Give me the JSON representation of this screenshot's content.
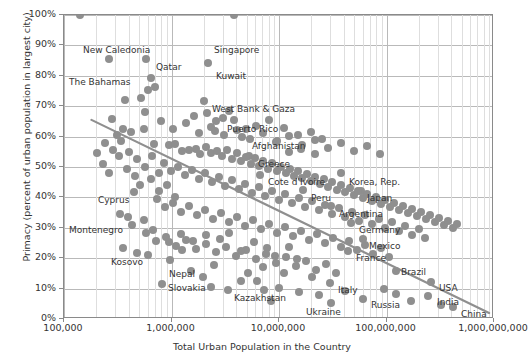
{
  "chart_data": {
    "type": "scatter",
    "title": "",
    "xlabel": "Total Urban Population in the Country",
    "ylabel": "Primacy (percent of urban population in largest city)",
    "x_scale": "log",
    "xlim": [
      100000,
      1000000000
    ],
    "ylim": [
      0,
      1.0
    ],
    "grid": true,
    "legend": "none",
    "x_ticks": [
      "100,000",
      "1,000,000",
      "10,000,000",
      "100,000,000",
      "1,000,000,000"
    ],
    "x_tick_values": [
      100000,
      1000000,
      10000000,
      100000000,
      1000000000
    ],
    "y_ticks": [
      "0%",
      "10%",
      "20%",
      "30%",
      "40%",
      "50%",
      "60%",
      "70%",
      "80%",
      "90%",
      "100%"
    ],
    "y_tick_values": [
      0,
      10,
      20,
      30,
      40,
      50,
      60,
      70,
      80,
      90,
      100
    ],
    "marker_color": "#8f8f8f",
    "trendline": {
      "color": "#8f8f8f",
      "x0": 180000,
      "y0": 65.5,
      "x1": 900000000,
      "y1": 2.0
    },
    "annotations": [
      {
        "label": "New Caledonia",
        "x": 82,
        "y": 44
      },
      {
        "label": "Singapore",
        "x": 213,
        "y": 44
      },
      {
        "label": "Qatar",
        "x": 155,
        "y": 61
      },
      {
        "label": "Kuwait",
        "x": 215,
        "y": 70
      },
      {
        "label": "The Bahamas",
        "x": 68,
        "y": 76
      },
      {
        "label": "West Bank & Gaza",
        "x": 211,
        "y": 103
      },
      {
        "label": "Puerto Rico",
        "x": 226,
        "y": 123
      },
      {
        "label": "Afghanistan",
        "x": 251,
        "y": 140
      },
      {
        "label": "Greece",
        "x": 257,
        "y": 158
      },
      {
        "label": "Cote d'Ivoire",
        "x": 267,
        "y": 176
      },
      {
        "label": "Korea, Rep.",
        "x": 348,
        "y": 176
      },
      {
        "label": "Peru",
        "x": 310,
        "y": 192
      },
      {
        "label": "Japan",
        "x": 366,
        "y": 192
      },
      {
        "label": "Argentina",
        "x": 338,
        "y": 208
      },
      {
        "label": "Germany",
        "x": 358,
        "y": 224
      },
      {
        "label": "Cyprus",
        "x": 97,
        "y": 194
      },
      {
        "label": "Mexico",
        "x": 368,
        "y": 240
      },
      {
        "label": "Montenegro",
        "x": 68,
        "y": 224
      },
      {
        "label": "France",
        "x": 355,
        "y": 252
      },
      {
        "label": "Kosovo",
        "x": 110,
        "y": 256
      },
      {
        "label": "Nepal",
        "x": 168,
        "y": 268
      },
      {
        "label": "Brazil",
        "x": 400,
        "y": 266
      },
      {
        "label": "Slovakia",
        "x": 167,
        "y": 282
      },
      {
        "label": "USA",
        "x": 438,
        "y": 282
      },
      {
        "label": "Kazakhstan",
        "x": 233,
        "y": 292
      },
      {
        "label": "Italy",
        "x": 337,
        "y": 284
      },
      {
        "label": "India",
        "x": 436,
        "y": 296
      },
      {
        "label": "Ukraine",
        "x": 305,
        "y": 306
      },
      {
        "label": "Russia",
        "x": 370,
        "y": 299
      },
      {
        "label": "China",
        "x": 460,
        "y": 308
      }
    ],
    "labeled_points": [
      {
        "name": "New Caledonia",
        "px": 79,
        "py": 14
      },
      {
        "name": "Singapore",
        "px": 233,
        "py": 14
      },
      {
        "name": "Qatar",
        "px": 145,
        "py": 58
      },
      {
        "name": "Kuwait",
        "px": 207,
        "py": 62
      },
      {
        "name": "The Bahamas",
        "px": 108,
        "py": 58
      },
      {
        "name": "West Bank & Gaza",
        "px": 203,
        "py": 100
      },
      {
        "name": "Puerto Rico",
        "px": 233,
        "py": 119
      },
      {
        "name": "Afghanistan",
        "px": 241,
        "py": 136
      },
      {
        "name": "Greece",
        "px": 248,
        "py": 155
      },
      {
        "name": "Cote d'Ivoire",
        "px": 259,
        "py": 174
      },
      {
        "name": "Korea, Rep.",
        "px": 340,
        "py": 172
      },
      {
        "name": "Peru",
        "px": 302,
        "py": 189
      },
      {
        "name": "Japan",
        "px": 360,
        "py": 190
      },
      {
        "name": "Argentina",
        "px": 330,
        "py": 205
      },
      {
        "name": "Germany",
        "px": 350,
        "py": 222
      },
      {
        "name": "Cyprus",
        "px": 133,
        "py": 191
      },
      {
        "name": "Mexico",
        "px": 362,
        "py": 238
      },
      {
        "name": "Montenegro",
        "px": 127,
        "py": 216
      },
      {
        "name": "France",
        "px": 347,
        "py": 250
      },
      {
        "name": "Kosovo",
        "px": 147,
        "py": 254
      },
      {
        "name": "Nepal",
        "px": 213,
        "py": 264
      },
      {
        "name": "Brazil",
        "px": 395,
        "py": 270
      },
      {
        "name": "Slovakia",
        "px": 161,
        "py": 283
      },
      {
        "name": "USA",
        "px": 430,
        "py": 281
      },
      {
        "name": "Kazakhstan",
        "px": 227,
        "py": 289
      },
      {
        "name": "Italy",
        "px": 329,
        "py": 282
      },
      {
        "name": "India",
        "px": 427,
        "py": 295
      },
      {
        "name": "Ukraine",
        "px": 298,
        "py": 291
      },
      {
        "name": "Russia",
        "px": 362,
        "py": 298
      },
      {
        "name": "China",
        "px": 452,
        "py": 306
      }
    ],
    "points_px": [
      [
        79,
        14
      ],
      [
        233,
        14
      ],
      [
        108,
        58
      ],
      [
        145,
        58
      ],
      [
        207,
        62
      ],
      [
        150,
        77
      ],
      [
        154,
        86
      ],
      [
        124,
        99
      ],
      [
        140,
        97
      ],
      [
        147,
        89
      ],
      [
        203,
        100
      ],
      [
        111,
        118
      ],
      [
        144,
        111
      ],
      [
        233,
        119
      ],
      [
        222,
        117
      ],
      [
        241,
        136
      ],
      [
        214,
        130
      ],
      [
        248,
        155
      ],
      [
        259,
        174
      ],
      [
        340,
        172
      ],
      [
        302,
        189
      ],
      [
        360,
        190
      ],
      [
        330,
        205
      ],
      [
        350,
        222
      ],
      [
        133,
        191
      ],
      [
        362,
        238
      ],
      [
        127,
        216
      ],
      [
        347,
        250
      ],
      [
        147,
        254
      ],
      [
        213,
        264
      ],
      [
        395,
        270
      ],
      [
        161,
        283
      ],
      [
        430,
        281
      ],
      [
        227,
        289
      ],
      [
        329,
        282
      ],
      [
        427,
        295
      ],
      [
        298,
        291
      ],
      [
        362,
        298
      ],
      [
        452,
        306
      ],
      [
        153,
        143
      ],
      [
        168,
        144
      ],
      [
        174,
        143
      ],
      [
        181,
        150
      ],
      [
        188,
        149
      ],
      [
        195,
        148
      ],
      [
        199,
        153
      ],
      [
        205,
        146
      ],
      [
        210,
        152
      ],
      [
        216,
        150
      ],
      [
        221,
        155
      ],
      [
        226,
        149
      ],
      [
        231,
        158
      ],
      [
        236,
        152
      ],
      [
        240,
        160
      ],
      [
        245,
        156
      ],
      [
        250,
        163
      ],
      [
        254,
        157
      ],
      [
        258,
        165
      ],
      [
        262,
        160
      ],
      [
        267,
        168
      ],
      [
        271,
        162
      ],
      [
        276,
        170
      ],
      [
        280,
        166
      ],
      [
        285,
        172
      ],
      [
        289,
        168
      ],
      [
        293,
        175
      ],
      [
        297,
        170
      ],
      [
        301,
        177
      ],
      [
        306,
        173
      ],
      [
        310,
        180
      ],
      [
        314,
        176
      ],
      [
        319,
        183
      ],
      [
        323,
        178
      ],
      [
        327,
        186
      ],
      [
        331,
        181
      ],
      [
        336,
        189
      ],
      [
        340,
        184
      ],
      [
        344,
        191
      ],
      [
        349,
        187
      ],
      [
        353,
        194
      ],
      [
        357,
        190
      ],
      [
        362,
        197
      ],
      [
        366,
        193
      ],
      [
        371,
        200
      ],
      [
        375,
        196
      ],
      [
        380,
        203
      ],
      [
        384,
        199
      ],
      [
        389,
        206
      ],
      [
        393,
        202
      ],
      [
        398,
        209
      ],
      [
        402,
        205
      ],
      [
        407,
        212
      ],
      [
        411,
        208
      ],
      [
        416,
        215
      ],
      [
        420,
        211
      ],
      [
        425,
        218
      ],
      [
        429,
        214
      ],
      [
        434,
        221
      ],
      [
        438,
        217
      ],
      [
        443,
        224
      ],
      [
        447,
        220
      ],
      [
        452,
        227
      ],
      [
        456,
        223
      ],
      [
        163,
        162
      ],
      [
        170,
        170
      ],
      [
        177,
        166
      ],
      [
        184,
        174
      ],
      [
        191,
        169
      ],
      [
        198,
        178
      ],
      [
        204,
        172
      ],
      [
        211,
        181
      ],
      [
        218,
        176
      ],
      [
        224,
        185
      ],
      [
        231,
        179
      ],
      [
        238,
        188
      ],
      [
        244,
        183
      ],
      [
        251,
        192
      ],
      [
        258,
        186
      ],
      [
        264,
        195
      ],
      [
        271,
        190
      ],
      [
        278,
        199
      ],
      [
        284,
        193
      ],
      [
        291,
        202
      ],
      [
        298,
        197
      ],
      [
        304,
        206
      ],
      [
        311,
        200
      ],
      [
        318,
        209
      ],
      [
        324,
        204
      ],
      [
        331,
        213
      ],
      [
        338,
        207
      ],
      [
        344,
        216
      ],
      [
        351,
        211
      ],
      [
        358,
        220
      ],
      [
        364,
        214
      ],
      [
        371,
        223
      ],
      [
        378,
        218
      ],
      [
        384,
        227
      ],
      [
        391,
        221
      ],
      [
        398,
        230
      ],
      [
        404,
        225
      ],
      [
        411,
        234
      ],
      [
        418,
        228
      ],
      [
        424,
        237
      ],
      [
        156,
        198
      ],
      [
        164,
        206
      ],
      [
        172,
        202
      ],
      [
        180,
        211
      ],
      [
        188,
        205
      ],
      [
        196,
        214
      ],
      [
        204,
        209
      ],
      [
        212,
        218
      ],
      [
        220,
        212
      ],
      [
        228,
        221
      ],
      [
        236,
        216
      ],
      [
        244,
        225
      ],
      [
        252,
        219
      ],
      [
        260,
        228
      ],
      [
        268,
        223
      ],
      [
        276,
        232
      ],
      [
        284,
        226
      ],
      [
        292,
        235
      ],
      [
        300,
        230
      ],
      [
        308,
        239
      ],
      [
        316,
        233
      ],
      [
        324,
        242
      ],
      [
        332,
        237
      ],
      [
        340,
        246
      ],
      [
        348,
        240
      ],
      [
        356,
        249
      ],
      [
        364,
        244
      ],
      [
        372,
        253
      ],
      [
        380,
        247
      ],
      [
        388,
        256
      ],
      [
        145,
        232
      ],
      [
        155,
        240
      ],
      [
        165,
        236
      ],
      [
        175,
        245
      ],
      [
        185,
        239
      ],
      [
        195,
        248
      ],
      [
        205,
        243
      ],
      [
        215,
        251
      ],
      [
        225,
        246
      ],
      [
        235,
        255
      ],
      [
        245,
        249
      ],
      [
        255,
        258
      ],
      [
        265,
        253
      ],
      [
        275,
        262
      ],
      [
        285,
        256
      ],
      [
        295,
        265
      ],
      [
        305,
        260
      ],
      [
        315,
        269
      ],
      [
        325,
        263
      ],
      [
        335,
        272
      ],
      [
        160,
        120
      ],
      [
        172,
        128
      ],
      [
        185,
        122
      ],
      [
        198,
        132
      ],
      [
        210,
        126
      ],
      [
        223,
        134
      ],
      [
        236,
        129
      ],
      [
        249,
        138
      ],
      [
        262,
        132
      ],
      [
        275,
        141
      ],
      [
        288,
        135
      ],
      [
        301,
        144
      ],
      [
        314,
        139
      ],
      [
        327,
        147
      ],
      [
        340,
        142
      ],
      [
        353,
        150
      ],
      [
        366,
        145
      ],
      [
        379,
        153
      ],
      [
        118,
        155
      ],
      [
        126,
        168
      ],
      [
        134,
        175
      ],
      [
        139,
        184
      ],
      [
        150,
        178
      ],
      [
        158,
        190
      ],
      [
        166,
        184
      ],
      [
        174,
        196
      ],
      [
        119,
        213
      ],
      [
        131,
        224
      ],
      [
        143,
        219
      ],
      [
        152,
        229
      ],
      [
        122,
        247
      ],
      [
        136,
        252
      ],
      [
        169,
        259
      ],
      [
        181,
        249
      ],
      [
        190,
        270
      ],
      [
        202,
        276
      ],
      [
        247,
        272
      ],
      [
        256,
        280
      ],
      [
        278,
        287
      ],
      [
        311,
        276
      ],
      [
        318,
        294
      ],
      [
        344,
        290
      ],
      [
        219,
        238
      ],
      [
        228,
        232
      ],
      [
        205,
        234
      ],
      [
        192,
        240
      ],
      [
        180,
        233
      ],
      [
        168,
        241
      ],
      [
        253,
        241
      ],
      [
        266,
        247
      ],
      [
        240,
        250
      ],
      [
        274,
        255
      ],
      [
        288,
        246
      ],
      [
        296,
        258
      ],
      [
        262,
        266
      ],
      [
        283,
        272
      ],
      [
        240,
        280
      ],
      [
        210,
        286
      ],
      [
        263,
        289
      ],
      [
        270,
        300
      ],
      [
        330,
        302
      ],
      [
        383,
        288
      ],
      [
        395,
        293
      ],
      [
        410,
        300
      ],
      [
        440,
        304
      ],
      [
        193,
        115
      ],
      [
        206,
        112
      ],
      [
        215,
        120
      ],
      [
        228,
        110
      ],
      [
        255,
        125
      ],
      [
        268,
        119
      ],
      [
        245,
        128
      ],
      [
        283,
        127
      ],
      [
        297,
        134
      ],
      [
        276,
        140
      ],
      [
        310,
        131
      ],
      [
        321,
        138
      ],
      [
        288,
        151
      ],
      [
        300,
        148
      ],
      [
        314,
        153
      ],
      [
        120,
        140
      ],
      [
        112,
        149
      ],
      [
        128,
        151
      ],
      [
        136,
        158
      ],
      [
        144,
        166
      ],
      [
        151,
        155
      ],
      [
        158,
        172
      ],
      [
        143,
        128
      ],
      [
        130,
        131
      ],
      [
        122,
        128
      ],
      [
        116,
        134
      ],
      [
        104,
        142
      ],
      [
        96,
        152
      ],
      [
        102,
        163
      ],
      [
        108,
        172
      ]
    ]
  }
}
